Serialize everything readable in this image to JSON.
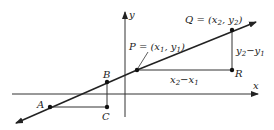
{
  "diagram": {
    "type": "slope-of-line-coordinate-diagram",
    "axes": {
      "x_label": "x",
      "y_label": "y"
    },
    "points": {
      "A": {
        "label": "A"
      },
      "B": {
        "label": "B"
      },
      "C": {
        "label": "C"
      },
      "P": {
        "label_prefix": "P = (x",
        "label_sub1": "1",
        "label_mid": ", y",
        "label_sub2": "1",
        "label_suffix": ")"
      },
      "Q": {
        "label_prefix": "Q = (x",
        "label_sub1": "2",
        "label_mid": ", y",
        "label_sub2": "2",
        "label_suffix": ")"
      },
      "R": {
        "label": "R"
      }
    },
    "run_label": {
      "a": "x",
      "a_sub": "2",
      "mid": "−x",
      "b_sub": "1"
    },
    "rise_label": {
      "a": "y",
      "a_sub": "2",
      "mid": "−y",
      "b_sub": "1"
    },
    "colors": {
      "line": "#222222",
      "axis": "#333333"
    }
  }
}
